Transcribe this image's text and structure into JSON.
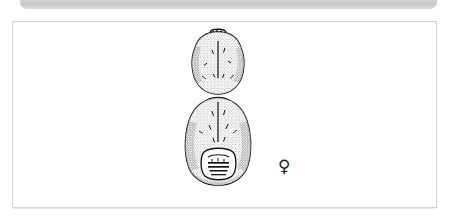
{
  "window": {
    "toolbar": {
      "name": "collapsed-toolbar-strip",
      "label": "",
      "color": "#c9c9c9"
    }
  },
  "figure": {
    "frame": {
      "border_color": "#d2d2d2",
      "background_color": "#ffffff"
    },
    "caption": "",
    "subject": {
      "name": "mite-dorsal-view",
      "description": "Dorsal view line drawing of a mite: rounded stippled cephalothorax above a larger ovate stippled idiosoma",
      "ink_color": "#1a1a1a",
      "parts": [
        {
          "name": "cephalothorax",
          "label": ""
        },
        {
          "name": "idiosoma",
          "label": ""
        },
        {
          "name": "genital-plate",
          "label": ""
        }
      ]
    },
    "annotations": [
      {
        "name": "sex-symbol",
        "glyph": "♀",
        "meaning": "female",
        "color": "#1b1b1b"
      }
    ]
  }
}
